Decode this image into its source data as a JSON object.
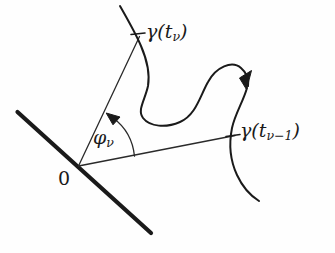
{
  "figure": {
    "background_color": "#fefefe",
    "ink_color": "#1a1a1a",
    "width": 335,
    "height": 253
  },
  "labels": {
    "point_current": {
      "name": "gamma-t-nu",
      "base": "γ(t",
      "sub": "ν",
      "close": ")",
      "full_text": "γ(tν)"
    },
    "point_previous": {
      "name": "gamma-t-nu-minus-1",
      "base": "γ(t",
      "sub": "ν−1",
      "close": ")",
      "full_text": "γ(tν−1)"
    },
    "angle": {
      "name": "phi-nu",
      "base": "φ",
      "sub": "ν",
      "full_text": "φν"
    },
    "origin": {
      "name": "origin",
      "full_text": "0"
    }
  },
  "geometry": {
    "origin_point": [
      78,
      166
    ],
    "point_current": [
      138,
      38
    ],
    "point_previous": [
      232,
      136
    ],
    "thick_line": {
      "start": [
        17,
        112
      ],
      "end": [
        151,
        233
      ],
      "stroke_width": 4
    },
    "ray_to_current": {
      "start": [
        78,
        166
      ],
      "end": [
        139,
        37
      ],
      "stroke_width": 1.2
    },
    "ray_to_previous": {
      "start": [
        78,
        166
      ],
      "end": [
        234,
        136
      ],
      "stroke_width": 1.2
    },
    "angle_arc": {
      "radius": 56,
      "from_angle_deg": -24,
      "to_angle_deg": -65,
      "arrow_at": [
        110,
        116
      ]
    },
    "curve": {
      "stroke_width": 2,
      "start": [
        120,
        6
      ],
      "end": [
        259,
        201
      ],
      "arrow_on_curve": [
        248,
        79
      ],
      "description": "S-shaped curve descending from top, dipping to a trough, rising over a hump, then descending through the previous point"
    },
    "tick_current": {
      "center": [
        138,
        34
      ],
      "length": 13
    },
    "tick_previous": {
      "center": [
        233,
        135
      ],
      "length": 13
    }
  }
}
